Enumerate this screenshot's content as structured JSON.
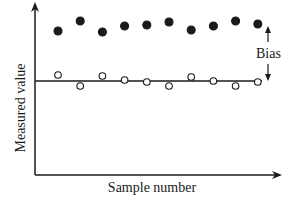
{
  "chart_data": {
    "type": "scatter",
    "title": "",
    "xlabel": "Sample number",
    "ylabel": "Measured value",
    "grid": false,
    "legend": null,
    "x": [
      1,
      2,
      3,
      4,
      5,
      6,
      7,
      8,
      9,
      10
    ],
    "true_value_line": 0,
    "series": [
      {
        "name": "biased measurements",
        "marker": "filled-circle",
        "values": [
          5.0,
          6.0,
          4.9,
          5.5,
          5.6,
          5.9,
          5.1,
          5.5,
          6.0,
          5.7
        ]
      },
      {
        "name": "unbiased measurements",
        "marker": "open-circle",
        "values": [
          0.6,
          -0.5,
          0.5,
          0.1,
          -0.1,
          -0.5,
          0.4,
          0.0,
          -0.5,
          -0.1
        ]
      }
    ],
    "annotations": [
      {
        "text": "Bias",
        "type": "double-arrow",
        "from": "true value line",
        "to": "biased points level"
      }
    ],
    "ylim": [
      -9,
      8
    ],
    "xlim": [
      0,
      11
    ]
  },
  "labels": {
    "xlabel": "Sample number",
    "ylabel": "Measured value",
    "bias": "Bias"
  },
  "colors": {
    "ink": "#1a1a1a",
    "background": "#ffffff"
  }
}
